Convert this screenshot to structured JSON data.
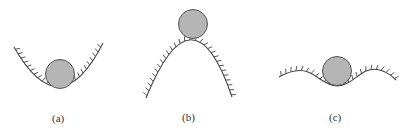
{
  "figure": {
    "panels": [
      {
        "id": "a",
        "label": "(a)",
        "description": "ball resting in bottom of concave-up bowl"
      },
      {
        "id": "b",
        "label": "(b)",
        "description": "ball balanced on top of convex hill"
      },
      {
        "id": "c",
        "label": "(c)",
        "description": "ball in shallow trough of wavy surface"
      }
    ],
    "colors": {
      "ball_fill": "#b5b5b5",
      "ball_stroke": "#555555",
      "surface": "#444444"
    }
  }
}
